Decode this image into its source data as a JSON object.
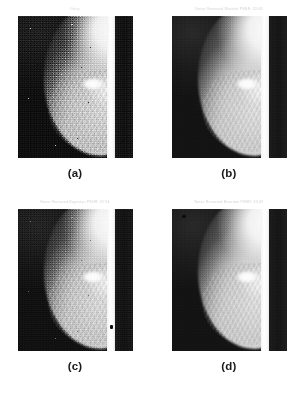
{
  "figure": {
    "background_color": "#ffffff",
    "width": 306,
    "height": 397,
    "layout": "2x2 grid of grayscale mammogram panels",
    "panels": [
      {
        "key": "a",
        "title": "Noisy",
        "label": "(a)",
        "noise_level": "heavy",
        "description": "Original noisy mammogram"
      },
      {
        "key": "b",
        "title": "Noise Removed Wavelet   PSNR: 32.68",
        "label": "(b)",
        "noise_level": "light",
        "description": "Wavelet denoised mammogram"
      },
      {
        "key": "c",
        "title": "Noise Removed Bayesian   PSNR: 31.94",
        "label": "(c)",
        "noise_level": "medium",
        "description": "Bayesian denoised mammogram"
      },
      {
        "key": "d",
        "title": "Noise Removed Bivariate   PSNR: 33.49",
        "label": "(d)",
        "noise_level": "light",
        "description": "Bivariate shrinkage denoised mammogram"
      }
    ]
  },
  "colors": {
    "page_background": "#ffffff",
    "title_text": "#c9c9c9",
    "label_text": "#1a1a1a",
    "scan_background": "#191919",
    "tissue_bright": "#f6f6f6",
    "edge_strip": "#ffffff"
  },
  "chart_data": {
    "type": "table",
    "columns": [
      "Panel",
      "Title",
      "Method",
      "PSNR (dB)"
    ],
    "rows": [
      [
        "(a)",
        "Noisy",
        "None (noisy input)",
        null
      ],
      [
        "(b)",
        "Noise Removed Wavelet   PSNR: 32.68",
        "Wavelet",
        32.68
      ],
      [
        "(c)",
        "Noise Removed Bayesian   PSNR: 31.94",
        "Bayesian",
        31.94
      ],
      [
        "(d)",
        "Noise Removed Bivariate   PSNR: 33.49",
        "Bivariate",
        33.49
      ]
    ],
    "ylabel": "PSNR (dB)",
    "categories": [
      "(a)",
      "(b)",
      "(c)",
      "(d)"
    ],
    "values": [
      null,
      32.68,
      31.94,
      33.49
    ]
  }
}
